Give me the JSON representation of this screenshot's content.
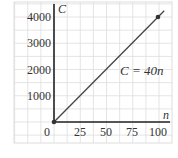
{
  "chart_data": {
    "type": "line",
    "title": "",
    "xlabel": "n",
    "ylabel": "C",
    "x_ticks": [
      0,
      25,
      50,
      75,
      100
    ],
    "x_tick_labels": [
      "0",
      "25",
      "50",
      "75",
      "100"
    ],
    "y_ticks": [
      1000,
      2000,
      3000,
      4000
    ],
    "y_tick_labels": [
      "1000",
      "2000",
      "3000",
      "4000"
    ],
    "xlim": [
      0,
      110
    ],
    "ylim": [
      0,
      4400
    ],
    "grid": true,
    "series": [
      {
        "name": "C = 40n",
        "x": [
          0,
          100
        ],
        "y": [
          0,
          4000
        ],
        "extends_beyond": true
      }
    ],
    "marked_points": [
      {
        "x": 0,
        "y": 0
      },
      {
        "x": 100,
        "y": 4000
      }
    ],
    "annotations": [
      {
        "text": "C = 40n",
        "position": "below line near x=80"
      }
    ],
    "colors": {
      "line": "#444444",
      "axes": "#222222",
      "grid": "#dddddd"
    }
  },
  "labels": {
    "x_axis": "n",
    "y_axis": "C",
    "equation": "C = 40n",
    "origin": "0"
  }
}
